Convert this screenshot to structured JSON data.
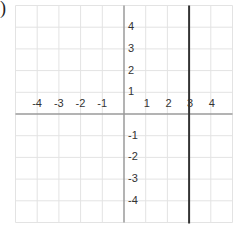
{
  "problem_marker": ")",
  "graph": {
    "x_range": [
      -5,
      5
    ],
    "y_range": [
      -5,
      5
    ],
    "origin_px": [
      124,
      114
    ],
    "unit_px": 21.7,
    "grid_color": "#e3e3e3",
    "axis_color": "#9a9a9a",
    "line_color": "#333333",
    "x_tick_labels": [
      {
        "value": -4,
        "text": "-4"
      },
      {
        "value": -3,
        "text": "-3"
      },
      {
        "value": -2,
        "text": "-2"
      },
      {
        "value": -1,
        "text": "-1"
      },
      {
        "value": 1,
        "text": "1"
      },
      {
        "value": 2,
        "text": "2"
      },
      {
        "value": 3,
        "text": "3"
      },
      {
        "value": 4,
        "text": "4"
      }
    ],
    "y_tick_labels": [
      {
        "value": 4,
        "text": "4"
      },
      {
        "value": 3,
        "text": "3"
      },
      {
        "value": 2,
        "text": "2"
      },
      {
        "value": 1,
        "text": "1"
      },
      {
        "value": -1,
        "text": "-1"
      },
      {
        "value": -2,
        "text": "-2"
      },
      {
        "value": -3,
        "text": "-3"
      },
      {
        "value": -4,
        "text": "-4"
      }
    ],
    "plotted_line": {
      "equation": "x = 3",
      "type": "vertical",
      "x": 3
    }
  },
  "chart_data": {
    "type": "line",
    "title": "",
    "xlabel": "",
    "ylabel": "",
    "xlim": [
      -5,
      5
    ],
    "ylim": [
      -5,
      5
    ],
    "grid": true,
    "x_ticks": [
      -4,
      -3,
      -2,
      -1,
      1,
      2,
      3,
      4
    ],
    "y_ticks": [
      -4,
      -3,
      -2,
      -1,
      1,
      2,
      3,
      4
    ],
    "series": [
      {
        "name": "x = 3",
        "x": [
          3,
          3
        ],
        "y": [
          -5,
          5
        ]
      }
    ]
  }
}
